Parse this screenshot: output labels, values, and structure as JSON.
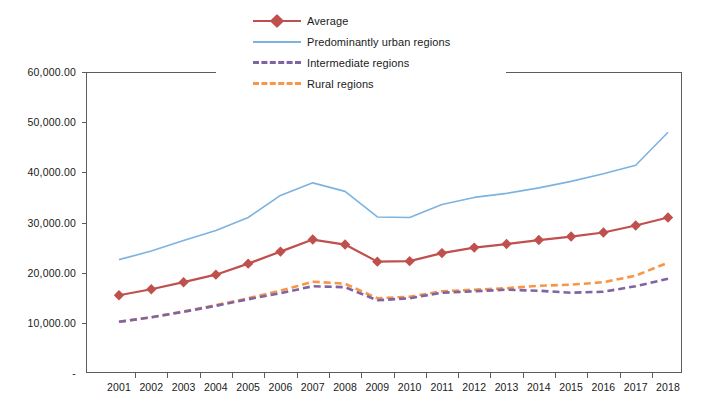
{
  "chart_data": {
    "type": "line",
    "title": "",
    "xlabel": "",
    "ylabel": "",
    "ylim": [
      0,
      60000
    ],
    "ytick_labels": [
      "-",
      "10,000.00",
      "20,000.00",
      "30,000.00",
      "40,000.00",
      "50,000.00",
      "60,000.00"
    ],
    "ytick_values": [
      0,
      10000,
      20000,
      30000,
      40000,
      50000,
      60000
    ],
    "grid": false,
    "legend_position": "top-center",
    "categories": [
      "2001",
      "2002",
      "2003",
      "2004",
      "2005",
      "2006",
      "2007",
      "2008",
      "2009",
      "2010",
      "2011",
      "2012",
      "2013",
      "2014",
      "2015",
      "2016",
      "2017",
      "2018"
    ],
    "series": [
      {
        "name": "Average",
        "color": "#C0504D",
        "style": "solid",
        "marker": "diamond",
        "values": [
          15500,
          16700,
          18100,
          19600,
          21800,
          24200,
          26600,
          25600,
          22200,
          22300,
          23900,
          25000,
          25700,
          26500,
          27200,
          28000,
          29400,
          31000
        ]
      },
      {
        "name": "Predominantly urban regions",
        "color": "#7DB3E0",
        "style": "solid",
        "marker": "none",
        "values": [
          22600,
          24300,
          26400,
          28400,
          31000,
          35400,
          37900,
          36200,
          31100,
          31000,
          33600,
          35000,
          35800,
          36900,
          38200,
          39700,
          41400,
          48000
        ]
      },
      {
        "name": "Intermediate regions",
        "color": "#8064A2",
        "style": "dashed",
        "marker": "none",
        "values": [
          10200,
          11100,
          12200,
          13400,
          14700,
          15900,
          17300,
          17100,
          14500,
          14900,
          16000,
          16300,
          16600,
          16400,
          16000,
          16200,
          17300,
          18800
        ]
      },
      {
        "name": "Rural regions",
        "color": "#F79646",
        "style": "dashed",
        "marker": "none",
        "values": [
          10200,
          11100,
          12300,
          13500,
          14900,
          16400,
          18200,
          17800,
          14900,
          15200,
          16300,
          16600,
          16900,
          17400,
          17600,
          18100,
          19400,
          22000
        ]
      }
    ]
  }
}
